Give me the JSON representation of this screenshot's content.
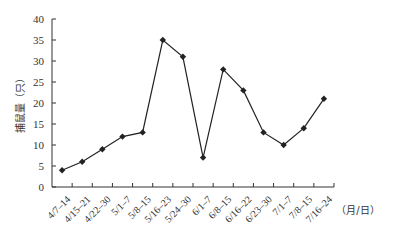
{
  "chart_data": {
    "type": "line",
    "title": "",
    "xlabel": "（月/日）",
    "ylabel": "捕鼠量（只）",
    "ylim": [
      0,
      40
    ],
    "yticks": [
      0,
      5,
      10,
      15,
      20,
      25,
      30,
      35,
      40
    ],
    "grid": false,
    "legend": null,
    "categories": [
      "4/7–14",
      "4/15–21",
      "4/22–30",
      "5/1–7",
      "5/8–15",
      "5/16–23",
      "5/24–30",
      "6/1–7",
      "6/8–15",
      "6/16–22",
      "6/23–30",
      "7/1–7",
      "7/8–15",
      "7/16–24"
    ],
    "series": [
      {
        "name": "捕鼠量",
        "values": [
          4,
          6,
          9,
          12,
          13,
          35,
          31,
          7,
          28,
          23,
          13,
          10,
          14,
          21
        ],
        "color": "#222222",
        "marker": "diamond"
      }
    ]
  }
}
